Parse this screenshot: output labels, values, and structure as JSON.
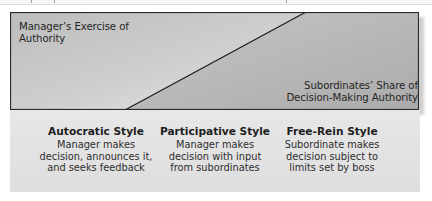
{
  "diagram": {
    "title_regions": {
      "manager": {
        "lines": [
          "Manager’s Exercise of",
          "Authority"
        ]
      },
      "subordinates": {
        "lines": [
          "Subordinates’ Share of",
          "Decision-Making Authority"
        ]
      }
    },
    "colors": {
      "manager_area": "#b8b8b8",
      "subordinate_area": "#b2b2b2",
      "light_highlight": "#e6e6e6",
      "border": "#2a2a2a",
      "panel": "#e2e2e2"
    },
    "styles": [
      {
        "title": "Autocratic Style",
        "description": [
          "Manager makes",
          "decision, announces it,",
          "and seeks feedback"
        ]
      },
      {
        "title": "Participative Style",
        "description": [
          "Manager makes",
          "decision with input",
          "from subordinates"
        ]
      },
      {
        "title": "Free-Rein Style",
        "description": [
          "Subordinate makes",
          "decision subject to",
          "limits set by boss"
        ]
      }
    ]
  }
}
